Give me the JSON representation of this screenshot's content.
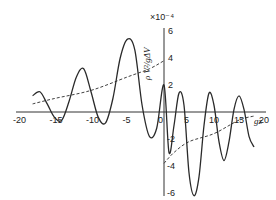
{
  "chart_data": {
    "type": "line",
    "title": "",
    "xlabel": "gz",
    "ylabel": "ρ V²/gΔV",
    "y_multiplier": "×10⁻⁴",
    "xlim": [
      -20,
      20
    ],
    "ylim": [
      -7,
      7
    ],
    "x_ticks": [
      "-20",
      "-15",
      "-10",
      "-5",
      "0",
      "5",
      "10",
      "15",
      "20"
    ],
    "y_ticks": [
      "6",
      "4",
      "2",
      "-2",
      "-4",
      "-6"
    ],
    "grid": false,
    "legend": "none",
    "series": [
      {
        "name": "oscillating wave profile",
        "style": "solid",
        "x": [
          -18,
          -17,
          -16,
          -15,
          -14,
          -13,
          -12,
          -11,
          -10,
          -9,
          -8,
          -7,
          -6,
          -5,
          -4,
          -3,
          -2,
          -1,
          0,
          1,
          2,
          3,
          4,
          5,
          6,
          7,
          8,
          9,
          10,
          11,
          12,
          13,
          14,
          15,
          16,
          17,
          18
        ],
        "y": [
          1.2,
          1.5,
          0.6,
          -0.4,
          -0.6,
          0.8,
          2.6,
          3.2,
          1.5,
          -0.4,
          -0.8,
          1.0,
          4.0,
          5.4,
          4.6,
          0.5,
          -1.8,
          -1.2,
          2.0,
          -3.0,
          -1.0,
          1.4,
          0.5,
          -4.5,
          -6.2,
          -4.8,
          -1.0,
          1.4,
          0.5,
          -2.2,
          -3.6,
          -2.2,
          0.2,
          1.2,
          0.2,
          -1.8,
          -2.6
        ]
      },
      {
        "name": "envelope (left)",
        "style": "dashed",
        "x": [
          -18,
          -15,
          -10,
          -5,
          -2,
          0
        ],
        "y": [
          0.6,
          1.0,
          1.6,
          2.6,
          3.2,
          3.8
        ]
      },
      {
        "name": "envelope (right)",
        "style": "dashed",
        "x": [
          0,
          2,
          5,
          10,
          15,
          18
        ],
        "y": [
          -3.8,
          -3.0,
          -2.2,
          -1.6,
          -0.6,
          -0.3
        ]
      }
    ]
  }
}
